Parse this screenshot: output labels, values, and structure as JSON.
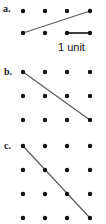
{
  "figure": {
    "type": "dot-lattice-line-segments",
    "background_color": "#ffffff",
    "dot_color": "#111111",
    "line_color": "#5b5b5b",
    "measure_color": "#111111",
    "dot_radius": 2.2,
    "width": 106,
    "height": 224,
    "caption": {
      "unit_label": "1 unit"
    },
    "parts": [
      {
        "id": "a",
        "label": "a.",
        "label_x": 3,
        "label_y": 4,
        "grid": {
          "columns_x": [
            23,
            45,
            67,
            90
          ],
          "rows_y": [
            11,
            33
          ],
          "cols": 4,
          "rows": 2
        },
        "segments": [
          {
            "name": "slope-line-a",
            "from_col": 0,
            "from_row": 1,
            "to_col": 3,
            "to_row": 0,
            "rise": 1,
            "run": 3,
            "slope": "1/3"
          }
        ],
        "measure": {
          "name": "one-unit-measure",
          "from_col": 2,
          "from_row": 1,
          "to_col": 3,
          "to_row": 1,
          "length_units": 1,
          "label": "1 unit"
        }
      },
      {
        "id": "b",
        "label": "b.",
        "label_x": 4,
        "label_y": 67,
        "grid": {
          "columns_x": [
            23,
            45,
            67,
            90
          ],
          "rows_y": [
            72,
            96,
            120
          ],
          "cols": 4,
          "rows": 3
        },
        "segments": [
          {
            "name": "slope-line-b",
            "from_col": 0,
            "from_row": 0,
            "to_col": 3,
            "to_row": 2,
            "rise": -2,
            "run": 3,
            "slope": "-2/3"
          }
        ],
        "measure": null
      },
      {
        "id": "c",
        "label": "c.",
        "label_x": 4,
        "label_y": 141,
        "grid": {
          "columns_x": [
            23,
            45,
            67,
            90
          ],
          "rows_y": [
            146,
            170,
            194,
            218
          ],
          "cols": 4,
          "rows": 4
        },
        "segments": [
          {
            "name": "slope-line-c",
            "from_col": 0,
            "from_row": 0,
            "to_col": 3,
            "to_row": 3,
            "rise": -3,
            "run": 3,
            "slope": "-1"
          }
        ],
        "measure": null
      }
    ]
  }
}
